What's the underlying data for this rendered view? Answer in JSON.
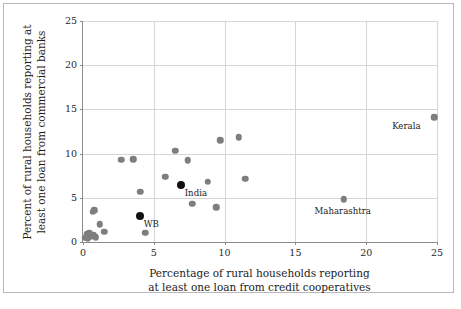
{
  "chart_data": {
    "type": "scatter",
    "title": "",
    "xlabel": "Percentage of rural households reporting\nat least one loan from credit cooperatives",
    "xlabel_line1": "Percentage of rural households reporting",
    "xlabel_line2": "at least one loan from credit cooperatives",
    "ylabel": "Percent of rural households reporting at\nleast one loan from commercial banks",
    "ylabel_line1": "Percent of rural households reporting at",
    "ylabel_line2": "least one loan from commercial banks",
    "xlim": [
      0,
      25
    ],
    "ylim": [
      0,
      25
    ],
    "xticks": [
      0,
      5,
      10,
      15,
      20,
      25
    ],
    "yticks": [
      0,
      5,
      10,
      15,
      20,
      25
    ],
    "xtick_labels": [
      "0",
      "5",
      "10",
      "15",
      "20",
      "25"
    ],
    "ytick_labels": [
      "0",
      "5",
      "10",
      "15",
      "20",
      "25"
    ],
    "grid": true,
    "legend": "none",
    "marker_color_default": "#7e7e7e",
    "marker_color_highlight": "#111111",
    "points": [
      {
        "x": 0.15,
        "y": 0.5,
        "label": "",
        "highlight": false
      },
      {
        "x": 0.25,
        "y": 0.9,
        "label": "",
        "highlight": false
      },
      {
        "x": 0.35,
        "y": 0.35,
        "label": "",
        "highlight": false
      },
      {
        "x": 0.45,
        "y": 1.0,
        "label": "",
        "highlight": false
      },
      {
        "x": 0.55,
        "y": 0.6,
        "label": "",
        "highlight": false
      },
      {
        "x": 0.7,
        "y": 3.4,
        "label": "",
        "highlight": false
      },
      {
        "x": 0.8,
        "y": 3.6,
        "label": "",
        "highlight": false
      },
      {
        "x": 0.75,
        "y": 0.8,
        "label": "",
        "highlight": false
      },
      {
        "x": 0.9,
        "y": 0.55,
        "label": "",
        "highlight": false
      },
      {
        "x": 1.2,
        "y": 2.0,
        "label": "",
        "highlight": false
      },
      {
        "x": 1.5,
        "y": 1.15,
        "label": "",
        "highlight": false
      },
      {
        "x": 2.7,
        "y": 9.3,
        "label": "",
        "highlight": false
      },
      {
        "x": 3.55,
        "y": 9.35,
        "label": "",
        "highlight": false
      },
      {
        "x": 4.05,
        "y": 5.7,
        "label": "",
        "highlight": false
      },
      {
        "x": 4.0,
        "y": 2.9,
        "label": "WB",
        "highlight": true
      },
      {
        "x": 4.4,
        "y": 1.05,
        "label": "",
        "highlight": false
      },
      {
        "x": 5.8,
        "y": 7.4,
        "label": "",
        "highlight": false
      },
      {
        "x": 6.5,
        "y": 10.3,
        "label": "",
        "highlight": false
      },
      {
        "x": 6.9,
        "y": 6.4,
        "label": "India",
        "highlight": true
      },
      {
        "x": 7.4,
        "y": 9.25,
        "label": "",
        "highlight": false
      },
      {
        "x": 7.7,
        "y": 4.35,
        "label": "",
        "highlight": false
      },
      {
        "x": 8.8,
        "y": 6.8,
        "label": "",
        "highlight": false
      },
      {
        "x": 9.4,
        "y": 3.95,
        "label": "",
        "highlight": false
      },
      {
        "x": 9.7,
        "y": 11.5,
        "label": "",
        "highlight": false
      },
      {
        "x": 11.0,
        "y": 11.85,
        "label": "",
        "highlight": false
      },
      {
        "x": 11.45,
        "y": 7.15,
        "label": "",
        "highlight": false
      },
      {
        "x": 18.4,
        "y": 4.85,
        "label": "Maharashtra",
        "highlight": false
      },
      {
        "x": 24.8,
        "y": 14.1,
        "label": "Kerala",
        "highlight": false
      }
    ],
    "annotations": [
      {
        "text": "Kerala",
        "x": 24.8,
        "y": 14.1,
        "placement": "left-below"
      },
      {
        "text": "Maharashtra",
        "x": 18.4,
        "y": 4.85,
        "placement": "below"
      },
      {
        "text": "India",
        "x": 6.9,
        "y": 6.4,
        "placement": "right-below"
      },
      {
        "text": "WB",
        "x": 4.0,
        "y": 2.9,
        "placement": "right-below"
      }
    ]
  },
  "caption": ""
}
